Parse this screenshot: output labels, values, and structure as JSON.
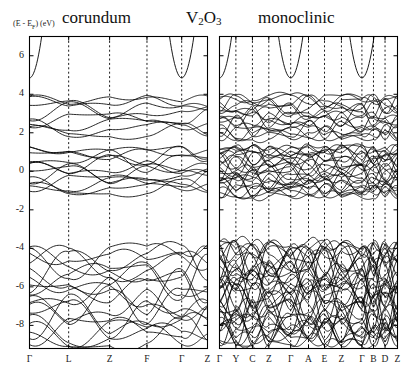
{
  "figure": {
    "title_left": "corundum",
    "title_compound": "V",
    "title_compound_sub1": "2",
    "title_compound_o": "O",
    "title_compound_sub2": "3",
    "title_right": "monoclinic",
    "ylabel_pre": "(E - E",
    "ylabel_sub": "F",
    "ylabel_post": ") (eV)",
    "background": "#ffffff",
    "line_color": "#000000",
    "grid_color": "#000000"
  },
  "chart_data": {
    "type": "line",
    "xlabel": "",
    "ylabel": "(E - E_F) (eV)",
    "ylim": [
      -9.2,
      7.0
    ],
    "yticks": [
      6,
      4,
      2,
      0,
      -2,
      -4,
      -6,
      -8
    ],
    "ytick_labels": [
      "6",
      "4",
      "2",
      "0",
      "-2",
      "-4",
      "-6",
      "-8"
    ],
    "grid": "vertical dashed lines at interior high-symmetry points",
    "legend": "none",
    "panels": [
      {
        "name": "corundum",
        "label": "corundum",
        "xticks": [
          "Γ",
          "L",
          "Z",
          "F",
          "Γ",
          "Z"
        ],
        "xtick_fracs": [
          0.0,
          0.22,
          0.45,
          0.66,
          0.855,
          1.0
        ],
        "band_groups": [
          {
            "name": "conduction-free-electron",
            "range": [
              4.2,
              7.0
            ],
            "count": 2,
            "note": "parabolic band dipping to ~4.9 eV at Γ, rising above 6 eV at zone edges"
          },
          {
            "name": "eg-conduction",
            "range": [
              1.8,
              4.0
            ],
            "count": 8,
            "note": "e_g manifold, crossing bands between 2 and 4 eV"
          },
          {
            "name": "t2g-near-fermi",
            "range": [
              -1.2,
              1.3
            ],
            "count": 12,
            "note": "dense t_2g metallic bands crossing E_F, degeneracies at L, Z, F, Γ"
          },
          {
            "name": "oxygen-2p",
            "range": [
              -9.1,
              -3.8
            ],
            "count": 18,
            "note": "O 2p valence manifold"
          }
        ]
      },
      {
        "name": "monoclinic",
        "label": "monoclinic",
        "xticks": [
          "Γ",
          "Y",
          "C",
          "Z",
          "Γ",
          "A",
          "E",
          "Z",
          "Γ",
          "B",
          "D",
          "Z"
        ],
        "xtick_fracs": [
          0.0,
          0.092,
          0.185,
          0.277,
          0.4,
          0.5,
          0.59,
          0.685,
          0.8,
          0.865,
          0.93,
          1.0
        ],
        "band_groups": [
          {
            "name": "conduction-free-electron",
            "range": [
              4.2,
              7.0
            ],
            "count": 4,
            "note": "parabolic bands dipping to ~4.8 eV at Γ points"
          },
          {
            "name": "eg-conduction",
            "range": [
              1.6,
              4.0
            ],
            "count": 16,
            "note": "doubled e_g manifold from monoclinic supercell"
          },
          {
            "name": "t2g-near-fermi",
            "range": [
              -1.4,
              1.4
            ],
            "count": 24,
            "note": "dense t_2g bands crossing E_F"
          },
          {
            "name": "oxygen-2p",
            "range": [
              -9.1,
              -3.6
            ],
            "count": 36,
            "note": "O 2p valence manifold, doubled band count"
          }
        ]
      }
    ]
  }
}
